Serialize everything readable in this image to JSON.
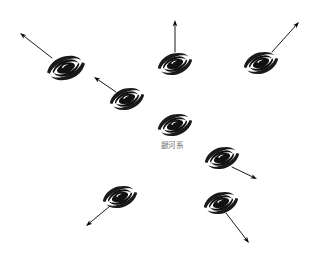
{
  "canvas": {
    "width": 315,
    "height": 254,
    "background": "#ffffff",
    "title": "Expanding universe: galaxies receding from the Milky Way"
  },
  "colors": {
    "galaxy": "#111111",
    "arrow": "#000000",
    "label_text": "#6f6f6f",
    "background": "#ffffff"
  },
  "center": {
    "label": "銀河系",
    "label_x": 172,
    "label_y": 146,
    "galaxy_x": 175,
    "galaxy_y": 125
  },
  "galaxies": [
    {
      "id": "galaxy-milky-way",
      "name": "milky-way-center",
      "x": 175,
      "y": 125,
      "scale": 1.0,
      "rotation": -22,
      "has_arrow": false,
      "label": "銀河系"
    },
    {
      "id": "galaxy-upper-left-far",
      "name": "galaxy-upper-left-far",
      "x": 66,
      "y": 68,
      "scale": 1.1,
      "rotation": -22,
      "has_arrow": true,
      "arrow_from_x": 52,
      "arrow_from_y": 58,
      "arrow_to_x": 20,
      "arrow_to_y": 33,
      "label": ""
    },
    {
      "id": "galaxy-upper-left-near",
      "name": "galaxy-upper-left-near",
      "x": 127,
      "y": 99,
      "scale": 1.0,
      "rotation": -22,
      "has_arrow": true,
      "arrow_from_x": 116,
      "arrow_from_y": 92,
      "arrow_to_x": 94,
      "arrow_to_y": 77,
      "label": ""
    },
    {
      "id": "galaxy-top-center",
      "name": "galaxy-top-center",
      "x": 175,
      "y": 64,
      "scale": 1.0,
      "rotation": -22,
      "has_arrow": true,
      "arrow_from_x": 175,
      "arrow_from_y": 52,
      "arrow_to_x": 175,
      "arrow_to_y": 20,
      "label": ""
    },
    {
      "id": "galaxy-top-right",
      "name": "galaxy-top-right",
      "x": 261,
      "y": 63,
      "scale": 1.0,
      "rotation": -22,
      "has_arrow": true,
      "arrow_from_x": 272,
      "arrow_from_y": 52,
      "arrow_to_x": 299,
      "arrow_to_y": 22,
      "label": ""
    },
    {
      "id": "galaxy-right-mid",
      "name": "galaxy-right-middle",
      "x": 222,
      "y": 158,
      "scale": 1.0,
      "rotation": -22,
      "has_arrow": true,
      "arrow_from_x": 232,
      "arrow_from_y": 167,
      "arrow_to_x": 257,
      "arrow_to_y": 179,
      "label": ""
    },
    {
      "id": "galaxy-lower-right",
      "name": "galaxy-lower-right",
      "x": 221,
      "y": 203,
      "scale": 1.0,
      "rotation": -22,
      "has_arrow": true,
      "arrow_from_x": 226,
      "arrow_from_y": 213,
      "arrow_to_x": 249,
      "arrow_to_y": 243,
      "label": ""
    },
    {
      "id": "galaxy-lower-left",
      "name": "galaxy-lower-left",
      "x": 120,
      "y": 197,
      "scale": 1.0,
      "rotation": -22,
      "has_arrow": true,
      "arrow_from_x": 110,
      "arrow_from_y": 206,
      "arrow_to_x": 86,
      "arrow_to_y": 226,
      "label": ""
    }
  ]
}
